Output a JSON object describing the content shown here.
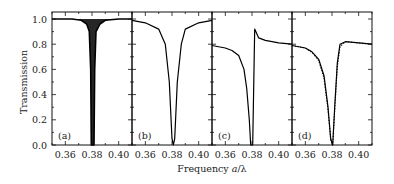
{
  "chart_data": [
    {
      "type": "line",
      "panel": "(a)",
      "xlim": [
        0.35,
        0.41
      ],
      "ylim": [
        0.0,
        1.05
      ],
      "x_ticks": [
        "0.36",
        "0.38",
        "0.40"
      ],
      "y_ticks": [
        "0.0",
        "0.2",
        "0.4",
        "0.6",
        "0.8",
        "1.0"
      ],
      "description": "Dense oscillating transmission near 1.0 with a deep dip to 0 around 0.380-0.382",
      "series": [
        {
          "name": "transmission",
          "style": "solid-dense",
          "x": [
            0.35,
            0.365,
            0.372,
            0.376,
            0.378,
            0.379,
            0.3795,
            0.3815,
            0.382,
            0.383,
            0.386,
            0.39,
            0.4,
            0.41
          ],
          "y": [
            1.0,
            1.0,
            0.99,
            0.96,
            0.9,
            0.6,
            0.0,
            0.0,
            0.6,
            0.9,
            0.96,
            0.99,
            1.0,
            1.0
          ]
        }
      ]
    },
    {
      "type": "line",
      "panel": "(b)",
      "xlim": [
        0.35,
        0.41
      ],
      "ylim": [
        0.0,
        1.05
      ],
      "x_ticks": [
        "0.36",
        "0.38",
        "0.40"
      ],
      "description": "Smooth Lorentzian-like dip centered at ~0.381",
      "series": [
        {
          "name": "transmission",
          "style": "solid",
          "x": [
            0.35,
            0.36,
            0.37,
            0.375,
            0.378,
            0.38,
            0.381,
            0.382,
            0.384,
            0.387,
            0.39,
            0.4,
            0.41
          ],
          "y": [
            0.99,
            0.97,
            0.92,
            0.8,
            0.5,
            0.05,
            0.0,
            0.05,
            0.5,
            0.8,
            0.92,
            0.97,
            0.99
          ]
        }
      ]
    },
    {
      "type": "line",
      "panel": "(c)",
      "xlim": [
        0.35,
        0.41
      ],
      "ylim": [
        0.0,
        1.05
      ],
      "x_ticks": [
        "0.36",
        "0.38",
        "0.40"
      ],
      "description": "Noisy baseline ~0.78, dip to 0 at ~0.380, sharp peak ~0.92 at 0.382 then ~0.82",
      "series": [
        {
          "name": "transmission",
          "style": "solid-noisy",
          "x": [
            0.35,
            0.36,
            0.365,
            0.37,
            0.374,
            0.376,
            0.378,
            0.379,
            0.3805,
            0.3815,
            0.382,
            0.385,
            0.39,
            0.4,
            0.41
          ],
          "y": [
            0.79,
            0.77,
            0.75,
            0.71,
            0.6,
            0.45,
            0.2,
            0.0,
            0.0,
            0.6,
            0.92,
            0.85,
            0.83,
            0.81,
            0.8
          ]
        }
      ]
    },
    {
      "type": "line",
      "panel": "(d)",
      "xlim": [
        0.35,
        0.41
      ],
      "ylim": [
        0.0,
        1.05
      ],
      "x_ticks": [
        "0.36",
        "0.38",
        "0.40"
      ],
      "description": "Measured (solid) and fitted (dotted) transmission; baseline ~0.78, broad dip to 0 at ~0.380, recovers to ~0.82",
      "series": [
        {
          "name": "measured",
          "style": "solid",
          "x": [
            0.35,
            0.36,
            0.365,
            0.37,
            0.374,
            0.377,
            0.379,
            0.3805,
            0.382,
            0.384,
            0.386,
            0.39,
            0.4,
            0.41
          ],
          "y": [
            0.79,
            0.77,
            0.74,
            0.68,
            0.55,
            0.3,
            0.05,
            0.0,
            0.3,
            0.65,
            0.8,
            0.82,
            0.81,
            0.8
          ]
        },
        {
          "name": "fit",
          "style": "dotted",
          "x": [
            0.35,
            0.36,
            0.365,
            0.37,
            0.374,
            0.377,
            0.379,
            0.3805,
            0.382,
            0.384,
            0.386,
            0.39,
            0.4,
            0.41
          ],
          "y": [
            0.79,
            0.77,
            0.735,
            0.67,
            0.53,
            0.28,
            0.04,
            0.0,
            0.28,
            0.62,
            0.78,
            0.82,
            0.81,
            0.8
          ]
        }
      ]
    }
  ],
  "labels": {
    "ylabel": "Transmission",
    "xlabel_prefix": "Frequency ",
    "xlabel_var": "a",
    "xlabel_suffix": "/λ",
    "panels": [
      "(a)",
      "(b)",
      "(c)",
      "(d)"
    ],
    "y_ticks": [
      "0.0",
      "0.2",
      "0.4",
      "0.6",
      "0.8",
      "1.0"
    ],
    "x_ticks": [
      "0.36",
      "0.38",
      "0.40"
    ]
  }
}
